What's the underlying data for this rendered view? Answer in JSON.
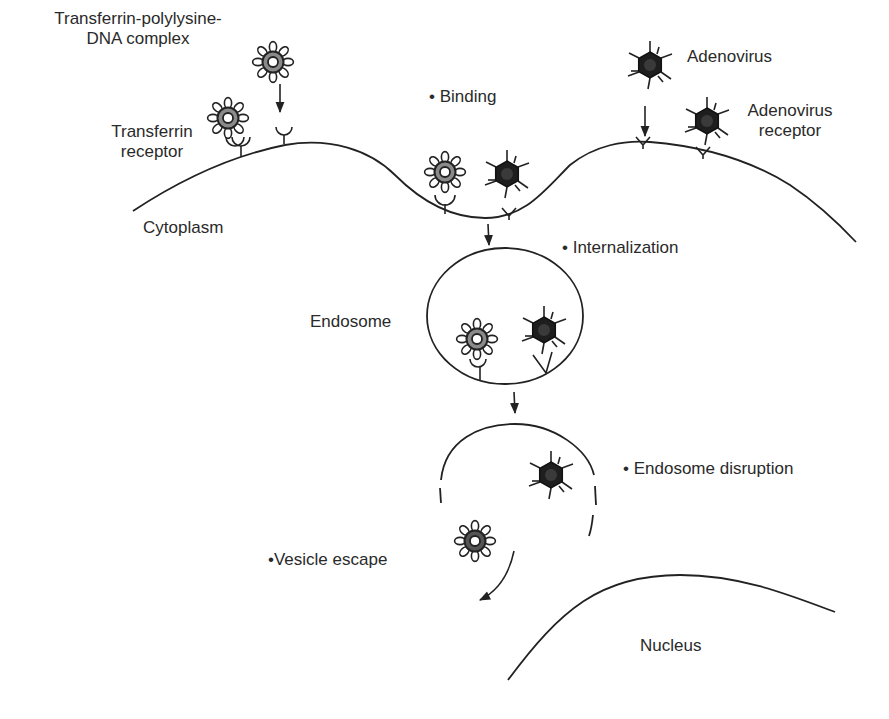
{
  "labels": {
    "tf_complex": [
      "Transferrin-polylysine-",
      "DNA complex"
    ],
    "tf_receptor": [
      "Transferrin",
      "receptor"
    ],
    "adenovirus": "Adenovirus",
    "adeno_receptor": [
      "Adenovirus",
      "receptor"
    ],
    "cytoplasm": "Cytoplasm",
    "endosome": "Endosome",
    "nucleus": "Nucleus"
  },
  "steps": {
    "binding": "• Binding",
    "internalization": "• Internalization",
    "disruption": "• Endosome disruption",
    "escape": "•Vesicle escape"
  },
  "colors": {
    "line": "#222222",
    "tf_ring": "#8a8a8a",
    "virus_fill": "#1e1e1e",
    "text": "#2a2a2a"
  }
}
